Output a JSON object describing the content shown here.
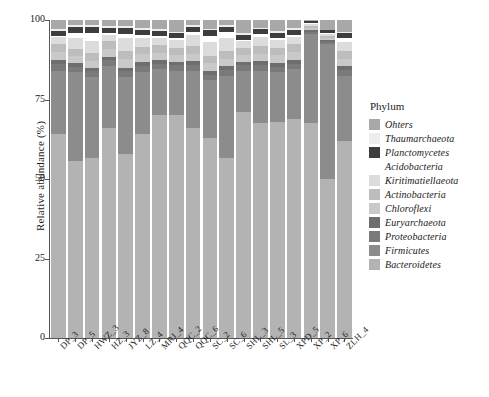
{
  "chart_data": {
    "type": "bar",
    "subtype": "stacked-percent",
    "title": "",
    "xlabel": "",
    "ylabel": "Relative abundance (%)",
    "ylim": [
      0,
      100
    ],
    "yticks": [
      0,
      25,
      50,
      75,
      100
    ],
    "ytick_labels": [
      "0",
      "25",
      "50",
      "75",
      "100"
    ],
    "grid": false,
    "legend_position": "right",
    "legend_title": "Phylum",
    "categories": [
      "DP_3",
      "DP_5",
      "HWZ_3",
      "HZ_3",
      "JYZ_8",
      "LZ_4",
      "MRJ_4",
      "QQC_2",
      "QQC_6",
      "SC_2",
      "SC_6",
      "SHL_3",
      "SHL_5",
      "SL_3",
      "XPD_5",
      "XP_2",
      "XP_6",
      "ZLH_4"
    ],
    "series": [
      {
        "name": "Bacteroidetes",
        "color": "#b3b3b3",
        "values": [
          64.0,
          55.5,
          56.5,
          66.0,
          58.0,
          64.0,
          70.0,
          70.0,
          66.0,
          63.0,
          56.5,
          71.0,
          67.5,
          68.0,
          69.0,
          67.5,
          50.0,
          62.0
        ]
      },
      {
        "name": "Firmicutes",
        "color": "#8c8c8c",
        "values": [
          20.0,
          28.0,
          25.5,
          19.5,
          24.0,
          19.5,
          14.5,
          14.0,
          18.0,
          18.0,
          26.0,
          13.0,
          16.5,
          15.5,
          15.5,
          28.0,
          42.5,
          20.5
        ]
      },
      {
        "name": "Proteobacteria",
        "color": "#7a7a7a",
        "values": [
          2.0,
          1.8,
          1.8,
          1.8,
          1.8,
          2.0,
          1.8,
          1.7,
          1.8,
          1.8,
          1.8,
          1.7,
          1.8,
          1.8,
          1.8,
          0.8,
          0.7,
          1.8
        ]
      },
      {
        "name": "Euryarchaeota",
        "color": "#6e6e6e",
        "values": [
          1.4,
          1.2,
          1.2,
          1.2,
          1.2,
          1.3,
          1.2,
          1.1,
          1.2,
          1.2,
          1.2,
          1.1,
          1.2,
          1.2,
          1.2,
          0.6,
          0.5,
          1.2
        ]
      },
      {
        "name": "Chloroflexi",
        "color": "#c9c9c9",
        "values": [
          2.6,
          2.2,
          2.2,
          2.4,
          2.6,
          2.4,
          2.2,
          2.2,
          2.3,
          2.4,
          2.3,
          2.2,
          2.3,
          2.4,
          2.4,
          0.7,
          0.7,
          2.3
        ]
      },
      {
        "name": "Actinobacteria",
        "color": "#bdbdbd",
        "values": [
          2.6,
          2.3,
          2.3,
          2.4,
          2.6,
          2.4,
          2.3,
          2.3,
          2.4,
          2.4,
          2.4,
          2.3,
          2.4,
          2.4,
          2.4,
          0.6,
          0.6,
          2.4
        ]
      },
      {
        "name": "Kiritimatiellaeota",
        "color": "#dcdcdc",
        "values": [
          2.0,
          3.4,
          4.0,
          2.0,
          4.0,
          2.7,
          2.4,
          2.5,
          3.5,
          4.2,
          4.0,
          2.0,
          2.8,
          2.5,
          2.5,
          0.5,
          0.5,
          3.0
        ]
      },
      {
        "name": "Acidobacteria",
        "color": "#ffffff",
        "values": [
          0.4,
          1.6,
          2.5,
          0.5,
          1.5,
          1.0,
          0.6,
          0.5,
          1.0,
          2.0,
          2.0,
          0.5,
          1.0,
          0.6,
          0.6,
          0.3,
          0.3,
          1.0
        ]
      },
      {
        "name": "Planctomycetes",
        "color": "#3d3d3d",
        "values": [
          1.6,
          1.8,
          1.8,
          1.8,
          1.7,
          1.6,
          1.5,
          1.5,
          1.6,
          1.7,
          1.6,
          1.5,
          1.6,
          1.6,
          1.6,
          0.6,
          1.0,
          1.6
        ]
      },
      {
        "name": "Thaumarchaeota",
        "color": "#ededed",
        "values": [
          0.6,
          0.5,
          0.5,
          0.6,
          0.8,
          0.6,
          0.6,
          0.5,
          0.5,
          0.6,
          0.5,
          0.5,
          0.5,
          0.6,
          0.6,
          0.2,
          0.2,
          0.5
        ]
      },
      {
        "name": "Ohters",
        "color": "#a8a8a8",
        "values": [
          2.8,
          1.7,
          1.7,
          1.8,
          1.8,
          2.5,
          2.9,
          3.7,
          1.7,
          2.7,
          1.7,
          4.2,
          2.4,
          3.4,
          2.4,
          0.2,
          3.0,
          3.7
        ]
      }
    ],
    "legend_entries": [
      {
        "label": "Ohters",
        "color": "#a8a8a8"
      },
      {
        "label": "Thaumarchaeota",
        "color": "#ededed"
      },
      {
        "label": "Planctomycetes",
        "color": "#3d3d3d"
      },
      {
        "label": "Acidobacteria",
        "color": "#ffffff"
      },
      {
        "label": "Kiritimatiellaeota",
        "color": "#dcdcdc"
      },
      {
        "label": "Actinobacteria",
        "color": "#bdbdbd"
      },
      {
        "label": "Chloroflexi",
        "color": "#c9c9c9"
      },
      {
        "label": "Euryarchaeota",
        "color": "#6e6e6e"
      },
      {
        "label": "Proteobacteria",
        "color": "#7a7a7a"
      },
      {
        "label": "Firmicutes",
        "color": "#8c8c8c"
      },
      {
        "label": "Bacteroidetes",
        "color": "#b3b3b3"
      }
    ]
  }
}
